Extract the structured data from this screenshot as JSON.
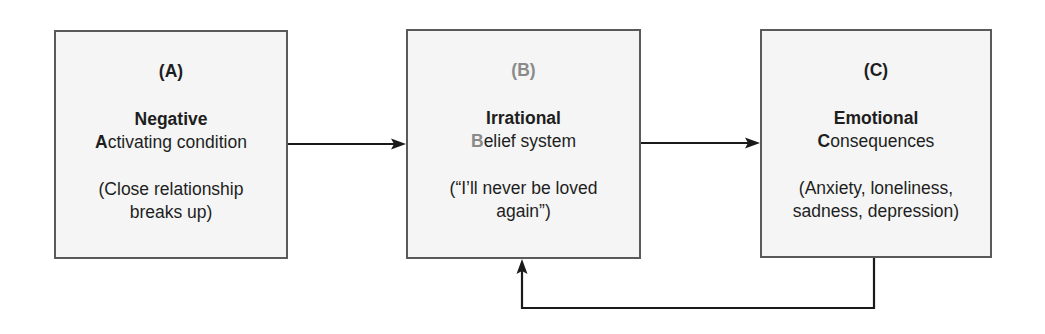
{
  "diagram": {
    "type": "flow",
    "boxes": [
      {
        "id": "A",
        "tag": "(A)",
        "title_bold": "Negative",
        "title_initial": "A",
        "title_rest": "ctivating condition",
        "desc_lines": [
          "(Close relationship",
          "breaks up)"
        ]
      },
      {
        "id": "B",
        "tag": "(B)",
        "title_bold": "Irrational",
        "title_initial": "B",
        "title_rest": "elief system",
        "desc_lines": [
          "(“I’ll never be loved",
          "again”)"
        ]
      },
      {
        "id": "C",
        "tag": "(C)",
        "title_bold": "Emotional",
        "title_initial": "C",
        "title_rest": "onsequences",
        "desc_lines": [
          "(Anxiety, loneliness,",
          "sadness, depression)"
        ]
      }
    ],
    "edges": [
      {
        "from": "A",
        "to": "B",
        "kind": "straight-arrow"
      },
      {
        "from": "B",
        "to": "C",
        "kind": "straight-arrow"
      },
      {
        "from": "C",
        "to": "B",
        "kind": "feedback-loop-below"
      }
    ],
    "colors": {
      "box_border": "#5a5a5a",
      "box_fill": "#f5f5f5",
      "text": "#1e1e1e",
      "highlight_gray": "#8a8a8a",
      "arrow": "#1a1a1a"
    }
  }
}
